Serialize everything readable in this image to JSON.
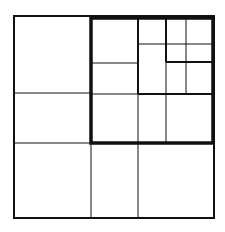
{
  "diagram": {
    "type": "quadtree-subdivision",
    "canvas": {
      "width": 225,
      "height": 232,
      "background": "#ffffff"
    },
    "line_color": "#111111",
    "outer_box": {
      "x1": 14,
      "y1": 16,
      "x2": 214,
      "y2": 218,
      "stroke": 2
    },
    "highlight_box": {
      "x1": 91,
      "y1": 18,
      "x2": 213,
      "y2": 143,
      "stroke": 3.5
    },
    "thin_lines": [
      {
        "x1": 14,
        "y1": 93,
        "x2": 91,
        "y2": 93
      },
      {
        "x1": 14,
        "y1": 143,
        "x2": 91,
        "y2": 143
      },
      {
        "x1": 91,
        "y1": 143,
        "x2": 91,
        "y2": 218
      },
      {
        "x1": 138,
        "y1": 143,
        "x2": 138,
        "y2": 218
      },
      {
        "x1": 91,
        "y1": 63,
        "x2": 138,
        "y2": 63
      },
      {
        "x1": 91,
        "y1": 94,
        "x2": 138,
        "y2": 94
      },
      {
        "x1": 138,
        "y1": 94,
        "x2": 138,
        "y2": 143
      },
      {
        "x1": 166,
        "y1": 94,
        "x2": 166,
        "y2": 143
      },
      {
        "x1": 138,
        "y1": 44,
        "x2": 213,
        "y2": 44
      },
      {
        "x1": 186,
        "y1": 18,
        "x2": 186,
        "y2": 94
      },
      {
        "x1": 166,
        "y1": 62,
        "x2": 166,
        "y2": 94
      }
    ],
    "medium_lines": [
      {
        "x1": 138,
        "y1": 18,
        "x2": 138,
        "y2": 94
      },
      {
        "x1": 138,
        "y1": 94,
        "x2": 213,
        "y2": 94
      },
      {
        "x1": 166,
        "y1": 18,
        "x2": 166,
        "y2": 62
      },
      {
        "x1": 166,
        "y1": 62,
        "x2": 213,
        "y2": 62
      }
    ]
  }
}
